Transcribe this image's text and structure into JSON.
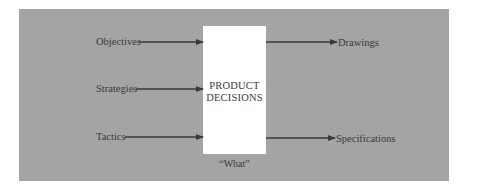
{
  "diagram": {
    "center": {
      "title_line1": "PRODUCT",
      "title_line2": "DECISIONS",
      "caption": "“What”"
    },
    "inputs": [
      {
        "label": "Objectives"
      },
      {
        "label": "Strategies"
      },
      {
        "label": "Tactics"
      }
    ],
    "outputs": [
      {
        "label": "Drawings"
      },
      {
        "label": "Specifications"
      }
    ],
    "colors": {
      "panel": "#a4a4a4",
      "box": "#ffffff",
      "arrow": "#3a3a3a",
      "text": "#3a3a3a"
    }
  }
}
